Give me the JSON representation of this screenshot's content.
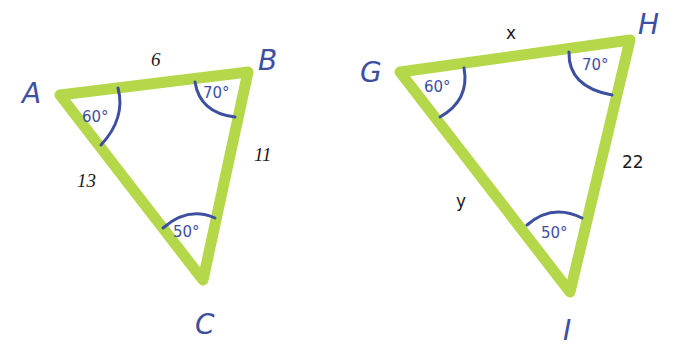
{
  "colors": {
    "triangle_stroke": "#b5d84a",
    "angle_arc": "#3d4f9f",
    "vertex_label": "#3d4f9f",
    "side_label": "#1a1a1a",
    "background": "#ffffff"
  },
  "triangles": [
    {
      "name": "ABC",
      "vertices": {
        "A": {
          "label": "A",
          "angle": "60°"
        },
        "B": {
          "label": "B",
          "angle": "70°"
        },
        "C": {
          "label": "C",
          "angle": "50°"
        }
      },
      "sides": {
        "AB": "6",
        "BC": "11",
        "AC": "13"
      }
    },
    {
      "name": "GHI",
      "vertices": {
        "G": {
          "label": "G",
          "angle": "60°"
        },
        "H": {
          "label": "H",
          "angle": "70°"
        },
        "I": {
          "label": "I",
          "angle": "50°"
        }
      },
      "sides": {
        "GH": "x",
        "HI": "22",
        "GI": "y"
      }
    }
  ]
}
